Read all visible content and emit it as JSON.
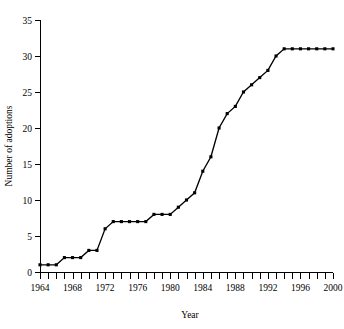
{
  "chart_data": {
    "type": "line",
    "title": "",
    "xlabel": "Year",
    "ylabel": "Number of adoptions",
    "xlim": [
      1964,
      2000
    ],
    "ylim": [
      0,
      35
    ],
    "ytick_values": [
      0,
      5,
      10,
      15,
      20,
      25,
      30,
      35
    ],
    "ytick_labels": [
      "0",
      "5",
      "10",
      "15",
      "20",
      "25",
      "30",
      "35"
    ],
    "xtick_labels": [
      "1964",
      "1968",
      "1972",
      "1976",
      "1980",
      "1984",
      "1988",
      "1992",
      "1996",
      "2000"
    ],
    "xtick_label_values": [
      1964,
      1968,
      1972,
      1976,
      1980,
      1984,
      1988,
      1992,
      1996,
      2000
    ],
    "xtick_minor_values": [
      1964,
      1965,
      1966,
      1967,
      1968,
      1969,
      1970,
      1971,
      1972,
      1973,
      1974,
      1975,
      1976,
      1977,
      1978,
      1979,
      1980,
      1981,
      1982,
      1983,
      1984,
      1985,
      1986,
      1987,
      1988,
      1989,
      1990,
      1991,
      1992,
      1993,
      1994,
      1995,
      1996,
      1997,
      1998,
      1999,
      2000
    ],
    "grid": false,
    "legend": false,
    "legend_position": "none",
    "marker": "square",
    "marker_color": "#000000",
    "line_color": "#000000",
    "x": [
      1964,
      1965,
      1966,
      1967,
      1968,
      1969,
      1970,
      1971,
      1972,
      1973,
      1974,
      1975,
      1976,
      1977,
      1978,
      1979,
      1980,
      1981,
      1982,
      1983,
      1984,
      1985,
      1986,
      1987,
      1988,
      1989,
      1990,
      1991,
      1992,
      1993,
      1994,
      1995,
      1996,
      1997,
      1998,
      1999,
      2000
    ],
    "values": [
      1,
      1,
      1,
      2,
      2,
      2,
      3,
      3,
      6,
      7,
      7,
      7,
      7,
      7,
      8,
      8,
      8,
      9,
      10,
      11,
      14,
      16,
      20,
      22,
      23,
      25,
      26,
      27,
      28,
      30,
      31,
      31,
      31,
      31,
      31,
      31,
      31
    ],
    "series": [
      {
        "name": "Number of adoptions",
        "values": [
          1,
          1,
          1,
          2,
          2,
          2,
          3,
          3,
          6,
          7,
          7,
          7,
          7,
          7,
          8,
          8,
          8,
          9,
          10,
          11,
          14,
          16,
          20,
          22,
          23,
          25,
          26,
          27,
          28,
          30,
          31,
          31,
          31,
          31,
          31,
          31,
          31
        ]
      }
    ]
  },
  "layout": {
    "plot_left": 40,
    "plot_right": 333,
    "plot_top": 20,
    "plot_bottom": 272
  }
}
